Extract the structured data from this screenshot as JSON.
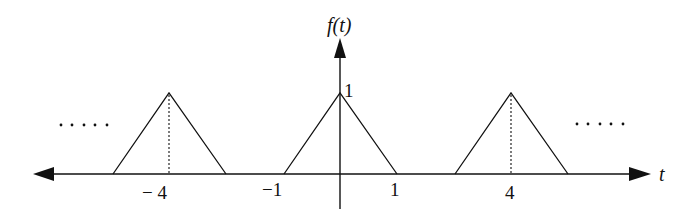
{
  "diagram": {
    "y_axis_label": "f(t)",
    "x_axis_label": "t",
    "peak_label": "1",
    "tick_labels": [
      {
        "text": "− 4",
        "value": -4
      },
      {
        "text": "−1",
        "value": -1
      },
      {
        "text": "1",
        "value": 1
      },
      {
        "text": "4",
        "value": 4
      }
    ],
    "continuation_left": ".....",
    "continuation_right": ".....",
    "pulses": [
      {
        "center": -4,
        "half_width": 1,
        "height": 1
      },
      {
        "center": 0,
        "half_width": 1,
        "height": 1
      },
      {
        "center": 4,
        "half_width": 1,
        "height": 1
      }
    ],
    "period": 4,
    "colors": {
      "stroke": "#111111",
      "background": "#ffffff"
    }
  }
}
